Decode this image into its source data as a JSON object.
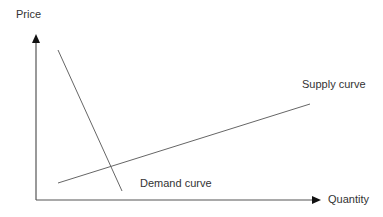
{
  "diagram": {
    "type": "supply-demand",
    "y_axis_label": "Price",
    "x_axis_label": "Quantity",
    "curves": [
      {
        "name": "Supply curve",
        "from": [
          58,
          183
        ],
        "to": [
          310,
          104
        ]
      },
      {
        "name": "Demand curve",
        "from": [
          58,
          50
        ],
        "to": [
          122,
          191
        ]
      }
    ],
    "line_color": "#666666",
    "axis_color": "#555555"
  }
}
